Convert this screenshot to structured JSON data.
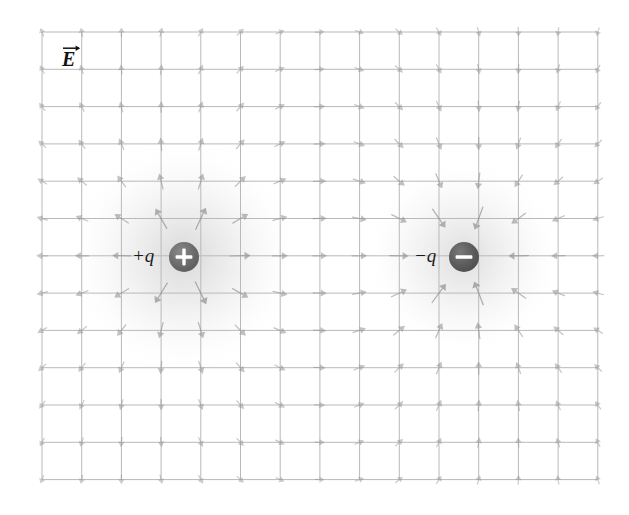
{
  "figure": {
    "kind": "electric-field-vector-map",
    "width": 629,
    "height": 515,
    "background_color": "#ffffff"
  },
  "labels": {
    "field_symbol": "E",
    "field_symbol_full": "E⃗",
    "positive_charge": "+q",
    "negative_charge": "−q",
    "plus_glyph": "+",
    "minus_glyph": "−"
  },
  "grid": {
    "x0": 42,
    "y0": 32,
    "columns": 14,
    "rows": 12,
    "cell_width": 39.7,
    "cell_height": 37.3,
    "line_color": "#b9b9b9",
    "line_width": 1.0,
    "show": true
  },
  "charges": [
    {
      "name": "positive-charge",
      "label": "+q",
      "sign": 1,
      "x": 184,
      "y": 257,
      "radius": 15,
      "fill": "#6e6e6e",
      "glyph_color": "#ffffff",
      "label_offset_x": -52,
      "label_offset_y": 1,
      "glow_radius": 118,
      "glow_color": "#9a9a9a"
    },
    {
      "name": "negative-charge",
      "label": "−q",
      "sign": -1,
      "x": 464,
      "y": 257,
      "radius": 15,
      "fill": "#5e5e5e",
      "glyph_color": "#ffffff",
      "label_offset_x": -50,
      "label_offset_y": 1,
      "glow_radius": 100,
      "glow_color": "#a2a2a2"
    }
  ],
  "vectors": {
    "color": "#8d8d8d",
    "min_length": 5,
    "max_length": 46,
    "head_length": 6,
    "head_width": 4.6,
    "shaft_width": 1.25,
    "placement": "grid-intersections",
    "suppress_radius": 26,
    "scale_exponent": 0.42,
    "scale_factor": 1.0,
    "description": "Arrow at each grid intersection showing the superposed Coulomb field of the two point charges; arrows point away from +q and toward -q, longest near the charges and vanishingly short at the corners."
  },
  "field_label": {
    "x": 62,
    "y": 44,
    "text": "E"
  }
}
